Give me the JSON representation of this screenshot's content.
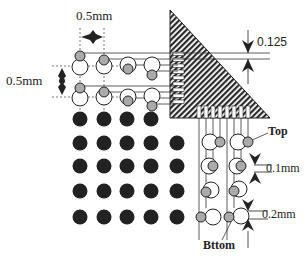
{
  "diagram": {
    "type": "pad-array-routing-schematic",
    "labels": {
      "pitch_horizontal": "0.5mm",
      "pitch_vertical": "0.5mm",
      "trace_spacing": "0.125",
      "offset_top": "0.1mm",
      "offset_bottom": "0.2mm",
      "top": "Top",
      "bottom": "Bttom"
    },
    "solid_ball_grid": {
      "rows": [
        {
          "cols": 4
        },
        {
          "cols": 5
        },
        {
          "cols": 5
        },
        {
          "cols": 5
        },
        {
          "cols": 5
        }
      ]
    },
    "colors": {
      "ink": "#222222",
      "hatch": "#2a2a2a",
      "via_fill": "#a8a8a8",
      "background": "#ffffff"
    }
  }
}
